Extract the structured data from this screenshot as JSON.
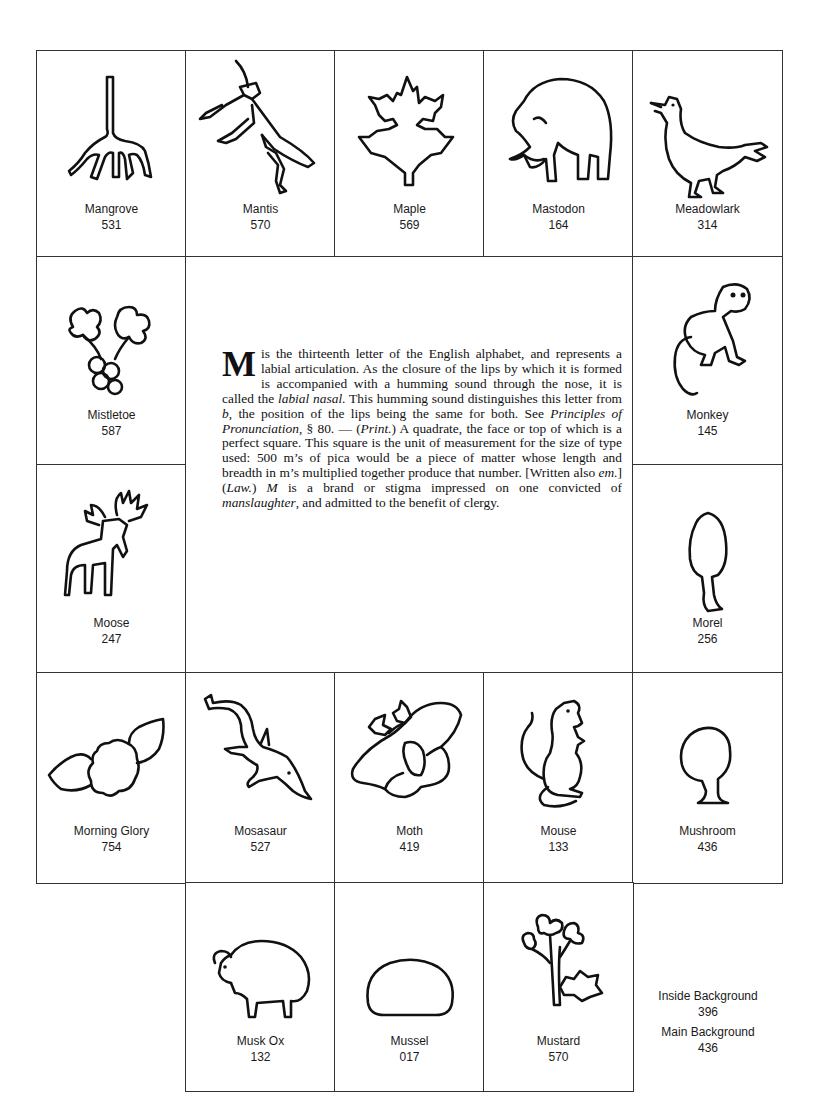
{
  "tiles": {
    "mangrove": {
      "name": "Mangrove",
      "code": "531",
      "icon": "mangrove-icon"
    },
    "mantis": {
      "name": "Mantis",
      "code": "570",
      "icon": "mantis-icon"
    },
    "maple": {
      "name": "Maple",
      "code": "569",
      "icon": "maple-leaf-icon"
    },
    "mastodon": {
      "name": "Mastodon",
      "code": "164",
      "icon": "mastodon-icon"
    },
    "meadowlark": {
      "name": "Meadowlark",
      "code": "314",
      "icon": "meadowlark-icon"
    },
    "mistletoe": {
      "name": "Mistletoe",
      "code": "587",
      "icon": "mistletoe-icon"
    },
    "monkey": {
      "name": "Monkey",
      "code": "145",
      "icon": "monkey-icon"
    },
    "moose": {
      "name": "Moose",
      "code": "247",
      "icon": "moose-icon"
    },
    "morel": {
      "name": "Morel",
      "code": "256",
      "icon": "morel-icon"
    },
    "morning_glory": {
      "name": "Morning Glory",
      "code": "754",
      "icon": "morning-glory-icon"
    },
    "mosasaur": {
      "name": "Mosasaur",
      "code": "527",
      "icon": "mosasaur-icon"
    },
    "moth": {
      "name": "Moth",
      "code": "419",
      "icon": "moth-icon"
    },
    "mouse": {
      "name": "Mouse",
      "code": "133",
      "icon": "mouse-icon"
    },
    "mushroom": {
      "name": "Mushroom",
      "code": "436",
      "icon": "mushroom-icon"
    },
    "musk_ox": {
      "name": "Musk Ox",
      "code": "132",
      "icon": "musk-ox-icon"
    },
    "mussel": {
      "name": "Mussel",
      "code": "017",
      "icon": "mussel-icon"
    },
    "mustard": {
      "name": "Mustard",
      "code": "570",
      "icon": "mustard-icon"
    }
  },
  "definition": {
    "dropcap": "M",
    "p1": "is the thirteenth letter of the English alphabet, and represents a labial articulation.  As the closure of the lips by which it is formed is accompanied with a humming sound through the nose, it is called the ",
    "i1": "labial nasal",
    "p2": ".  This humming sound distinguishes this letter from ",
    "i2": "b",
    "p3": ", the position of the lips being the same for both.  See ",
    "i3": "Principles of Pronunciation",
    "p4": ", § 80. — (",
    "i4": "Print.",
    "p5": ") A quadrate, the face or top of which is a perfect square.  This square is the unit of measurement for the size of type used: 500 m’s of pica would be a piece of matter whose length and breadth in m’s multiplied together produce that number.  [Written also ",
    "i5": "em.",
    "p6": "] (",
    "i6": "Law.",
    "p7": ") ",
    "i7": "M",
    "p8": " is a brand or stigma impressed on one convicted of ",
    "i8": "manslaughter",
    "p9": ", and admitted to the benefit of clergy."
  },
  "backgrounds": {
    "inside": {
      "name": "Inside Background",
      "code": "396"
    },
    "main": {
      "name": "Main Background",
      "code": "436"
    }
  }
}
